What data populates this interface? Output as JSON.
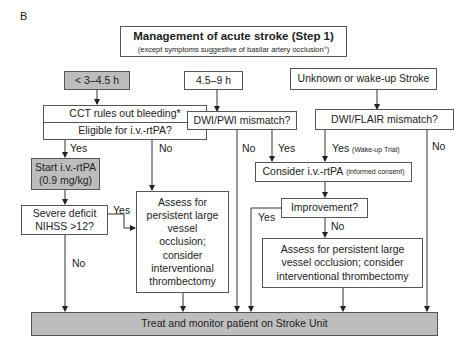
{
  "panel_label": "B",
  "title": {
    "main": "Management of acute stroke (Step 1)",
    "sub": "(except symptoms suggestive of basilar artery occlusion°)"
  },
  "time_windows": [
    {
      "label": "< 3–4.5 h",
      "highlight": true
    },
    {
      "label": "4.5–9 h",
      "highlight": false
    },
    {
      "label": "Unknown or wake-up Stroke",
      "highlight": false
    }
  ],
  "nodes": {
    "cct": {
      "line1": "CCT rules out bleeding*",
      "line2": "Eligible for i.v.-rtPA?"
    },
    "dwi_pwi": "DWI/PWI mismatch?",
    "dwi_flair": "DWI/FLAIR mismatch?",
    "start_rtpa": {
      "line1": "Start i.v.-rtPA",
      "line2": "(0.9 mg/kg)"
    },
    "consider_rtpa": {
      "main": "Consider i.v.-rtPA",
      "note": "(informed consent)"
    },
    "severe_deficit": {
      "line1": "Severe deficit",
      "line2": "NIHSS >12?"
    },
    "assess_left": "Assess for persistent large vessel occlusion; consider interventional thrombectomy",
    "improvement": "Improvement?",
    "assess_right": "Assess for persistent large vessel occlusion; consider interventional thrombectomy",
    "treat": "Treat and monitor patient on Stroke Unit"
  },
  "edge_labels": {
    "cct_yes": "Yes",
    "cct_no": "No",
    "pwi_no": "No",
    "pwi_yes": "Yes",
    "flair_yes": "Yes",
    "flair_yes_note": "(Wake-up Trial)",
    "flair_no": "No",
    "severe_yes": "Yes",
    "severe_no": "No",
    "improvement_yes": "Yes",
    "improvement_no": "No"
  },
  "colors": {
    "highlight_fill": "#bdbdbd",
    "line": "#333333"
  }
}
